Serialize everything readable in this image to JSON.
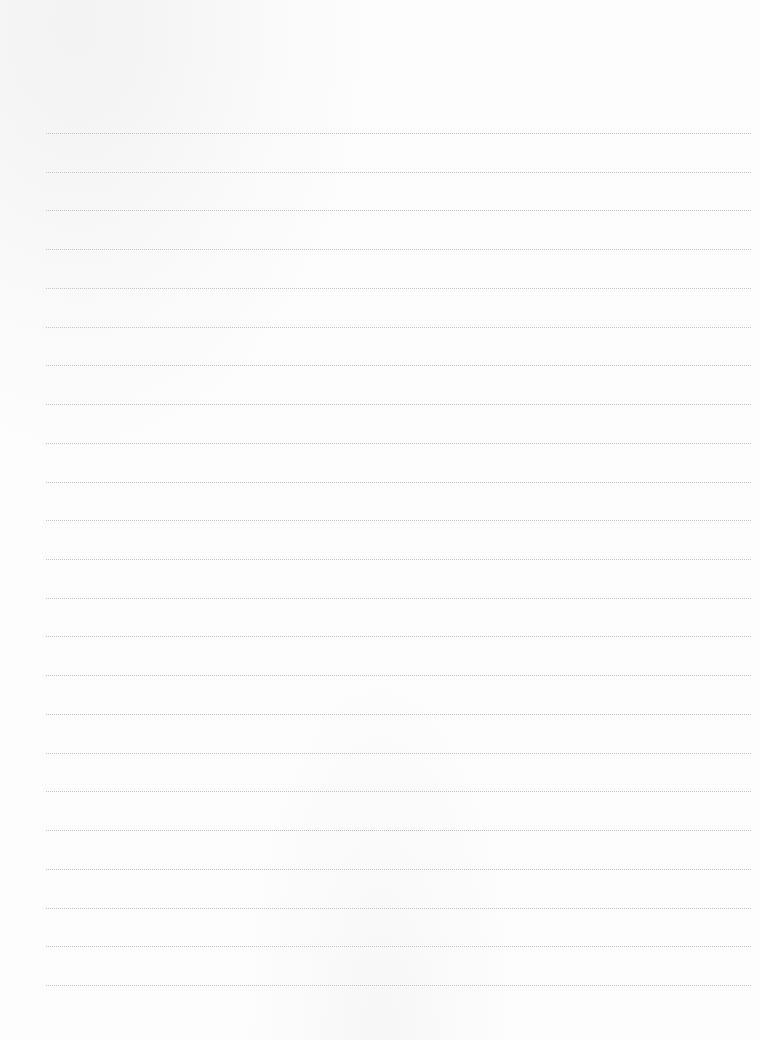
{
  "page": {
    "type": "lined-paper",
    "background_color": "#fdfdfd",
    "line_color": "#c4c4c4",
    "line_style": "dotted"
  },
  "rules": {
    "count": 23,
    "first_y": 133,
    "spacing": 38.73,
    "left": 46,
    "right": 751
  }
}
